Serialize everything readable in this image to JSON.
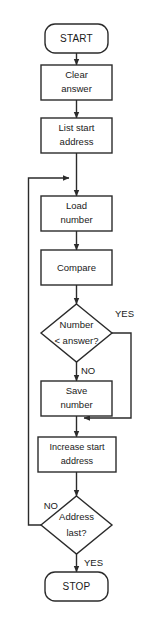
{
  "diagram": {
    "type": "flowchart",
    "colors": {
      "background": "#ffffff",
      "stroke": "#2b2b2b",
      "fill": "#ffffff",
      "text": "#1a1a1a"
    },
    "nodes": [
      {
        "id": "start",
        "shape": "terminator",
        "label": "START"
      },
      {
        "id": "clear-answer",
        "shape": "process",
        "line1": "Clear",
        "line2": "answer"
      },
      {
        "id": "list-start-address",
        "shape": "process",
        "line1": "List start",
        "line2": "address"
      },
      {
        "id": "load-number",
        "shape": "process",
        "line1": "Load",
        "line2": "number"
      },
      {
        "id": "compare",
        "shape": "process",
        "line1": "Compare",
        "line2": ""
      },
      {
        "id": "number-less-than-answer",
        "shape": "decision",
        "line1": "Number",
        "line2": "< answer?"
      },
      {
        "id": "save-number",
        "shape": "process",
        "line1": "Save",
        "line2": "number"
      },
      {
        "id": "increase-start-address",
        "shape": "process",
        "line1": "Increase start",
        "line2": "address"
      },
      {
        "id": "address-last",
        "shape": "decision",
        "line1": "Address",
        "line2": "last?"
      },
      {
        "id": "stop",
        "shape": "terminator",
        "label": "STOP"
      }
    ],
    "branch_labels": {
      "yes_number": "YES",
      "no_number": "NO",
      "no_address": "NO",
      "yes_address": "YES"
    }
  }
}
